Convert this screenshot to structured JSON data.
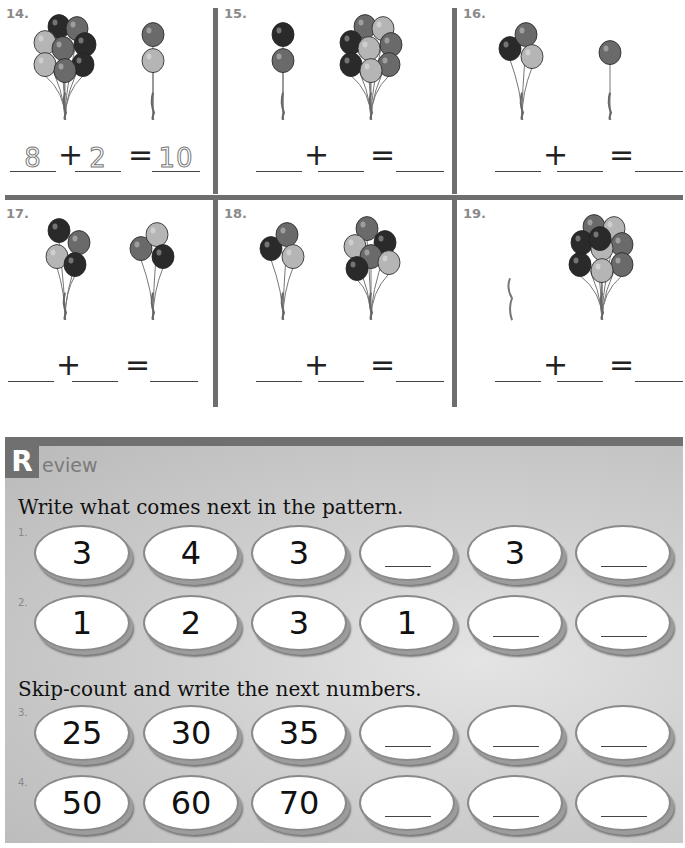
{
  "addition_problems": [
    {
      "number": "14.",
      "left_count": 8,
      "right_count": 2,
      "answer": {
        "addend1": "8",
        "addend2": "2",
        "sum": "10",
        "traced": true
      }
    },
    {
      "number": "15.",
      "left_count": 2,
      "right_count": 8,
      "answer": {
        "addend1": "",
        "addend2": "",
        "sum": "",
        "traced": false
      }
    },
    {
      "number": "16.",
      "left_count": 3,
      "right_count": 1,
      "answer": {
        "addend1": "",
        "addend2": "",
        "sum": "",
        "traced": false
      }
    },
    {
      "number": "17.",
      "left_count": 4,
      "right_count": 3,
      "answer": {
        "addend1": "",
        "addend2": "",
        "sum": "",
        "traced": false
      }
    },
    {
      "number": "18.",
      "left_count": 3,
      "right_count": 6,
      "answer": {
        "addend1": "",
        "addend2": "",
        "sum": "",
        "traced": false
      }
    },
    {
      "number": "19.",
      "left_count": 0,
      "right_count": 9,
      "answer": {
        "addend1": "",
        "addend2": "",
        "sum": "",
        "traced": false
      }
    }
  ],
  "operators": {
    "plus": "+",
    "equals": "="
  },
  "review": {
    "initial": "R",
    "rest": "eview",
    "instruction1": "Write what comes next in the pattern.",
    "instruction2": "Skip-count and write the next numbers.",
    "rows": [
      {
        "label": "1.",
        "items": [
          "3",
          "4",
          "3",
          "",
          "3",
          ""
        ]
      },
      {
        "label": "2.",
        "items": [
          "1",
          "2",
          "3",
          "1",
          "",
          ""
        ]
      },
      {
        "label": "3.",
        "items": [
          "25",
          "30",
          "35",
          "",
          "",
          ""
        ]
      },
      {
        "label": "4.",
        "items": [
          "50",
          "60",
          "70",
          "",
          "",
          ""
        ]
      }
    ]
  },
  "colors": {
    "rule": "#6e6e6e",
    "balloon_dark": "#2a2a2a",
    "balloon_mid": "#6a6a6a",
    "balloon_light": "#b5b5b5"
  }
}
